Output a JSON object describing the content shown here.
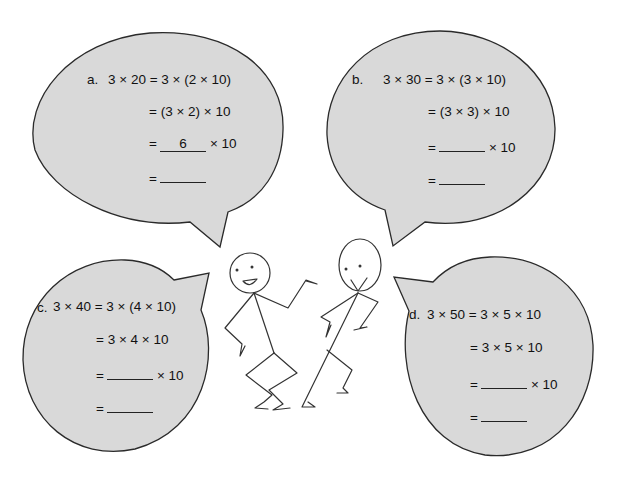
{
  "colors": {
    "bubble_fill": "#d9d9d9",
    "bubble_stroke": "#2a2a2a",
    "background": "#ffffff",
    "ink": "#111111"
  },
  "problems": [
    {
      "id": "a",
      "label": "a.",
      "lines": [
        {
          "text": "3 × 20 = 3 × (2 × 10)"
        },
        {
          "text": "= (3 × 2) × 10"
        },
        {
          "prefix": "=",
          "blank": "6",
          "suffix": "× 10"
        },
        {
          "prefix": "=",
          "blank": ""
        }
      ]
    },
    {
      "id": "b",
      "label": "b.",
      "lines": [
        {
          "text": "3 × 30 = 3 × (3 × 10)"
        },
        {
          "text": "= (3 × 3) × 10"
        },
        {
          "prefix": "=",
          "blank": "",
          "suffix": "× 10"
        },
        {
          "prefix": "=",
          "blank": ""
        }
      ]
    },
    {
      "id": "c",
      "label": "c.",
      "lines": [
        {
          "text": "3 × 40 = 3 × (4 × 10)"
        },
        {
          "text": "= 3 × 4 × 10"
        },
        {
          "prefix": "=",
          "blank": "",
          "suffix": "× 10"
        },
        {
          "prefix": "=",
          "blank": ""
        }
      ]
    },
    {
      "id": "d",
      "label": "d.",
      "lines": [
        {
          "text": "3 × 50 = 3 × 5 × 10"
        },
        {
          "text": "= 3 × 5 × 10"
        },
        {
          "prefix": "=",
          "blank": "",
          "suffix": "× 10"
        },
        {
          "prefix": "=",
          "blank": ""
        }
      ]
    }
  ],
  "illustration": {
    "figures": [
      "stick-figure-left",
      "stick-figure-right"
    ]
  }
}
